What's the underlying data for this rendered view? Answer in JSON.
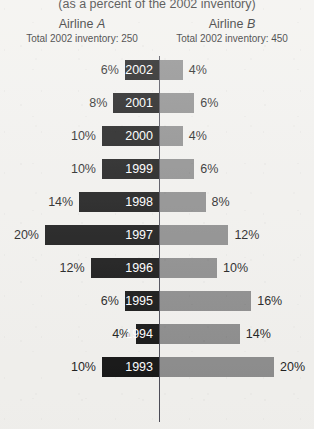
{
  "subtitle": "(as a percent of the 2002 inventory)",
  "columns": {
    "left": {
      "name": "Airline",
      "italic": "A",
      "total": "Total 2002 inventory: 250"
    },
    "right": {
      "name": "Airline",
      "italic": "B",
      "total": "Total 2002 inventory: 450"
    }
  },
  "colors": {
    "left_bar": "#121212",
    "right_bar": "#8a8a8a",
    "axis": "#4a4a55",
    "background": "#f2f1ee",
    "year_text": "#ffffff"
  },
  "chart_data": {
    "type": "bar",
    "orientation": "horizontal-diverging",
    "title": "",
    "subtitle": "(as a percent of the 2002 inventory)",
    "xlabel": "",
    "ylabel": "",
    "categories": [
      "2002",
      "2001",
      "2000",
      "1999",
      "1998",
      "1997",
      "1996",
      "1995",
      "1994",
      "1993"
    ],
    "series": [
      {
        "name": "Airline A",
        "side": "left",
        "values": [
          6,
          8,
          10,
          10,
          14,
          20,
          12,
          6,
          4,
          10
        ]
      },
      {
        "name": "Airline B",
        "side": "right",
        "values": [
          4,
          6,
          4,
          6,
          8,
          12,
          10,
          16,
          14,
          20
        ]
      }
    ],
    "value_labels": {
      "left": [
        "6%",
        "8%",
        "10%",
        "10%",
        "14%",
        "20%",
        "12%",
        "6%",
        "4%",
        "10%"
      ],
      "right": [
        "4%",
        "6%",
        "4%",
        "6%",
        "8%",
        "12%",
        "10%",
        "16%",
        "14%",
        "20%"
      ]
    },
    "units": "percent",
    "xlim": [
      0,
      20
    ],
    "grid": false,
    "legend": "none",
    "annotations": [
      "Airline A — Total 2002 inventory: 250",
      "Airline B — Total 2002 inventory: 450"
    ]
  },
  "geometry": {
    "axis_x": 159,
    "row_pitch": 33,
    "row_top": 4,
    "bar_height": 20,
    "px_per_percent": 5.7
  }
}
